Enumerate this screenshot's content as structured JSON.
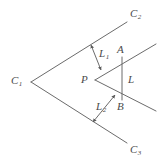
{
  "figure": {
    "kind": "line-diagram",
    "width": 163,
    "height": 163,
    "background_color": "#ffffff",
    "stroke_color": "#6b6b6b",
    "label_color": "#4a4a4a"
  },
  "labels": {
    "c1": "C",
    "c1_sub": "1",
    "c2": "C",
    "c2_sub": "2",
    "c3": "C",
    "c3_sub": "3",
    "p": "P",
    "a": "A",
    "b": "B",
    "l": "L",
    "l1": "L",
    "l1_sub": "1",
    "l2": "L",
    "l2_sub": "2"
  },
  "geometry": {
    "vertices": {
      "C1": [
        31,
        82
      ],
      "C2_end": [
        127,
        22
      ],
      "C3_end": [
        127,
        143
      ],
      "P": [
        95,
        80
      ],
      "A": [
        122,
        57
      ],
      "B": [
        122,
        100
      ],
      "A_ray_end": [
        156,
        44
      ],
      "B_ray_end": [
        156,
        111
      ]
    },
    "segments": [
      {
        "name": "cone1-upper-ray",
        "from": "C1",
        "to": "C2_end"
      },
      {
        "name": "cone1-lower-ray",
        "from": "C1",
        "to": "C3_end"
      },
      {
        "name": "cone2-upper-ray",
        "from": "P",
        "to": "A_ray_end"
      },
      {
        "name": "cone2-lower-ray",
        "from": "P",
        "to": "B_ray_end"
      },
      {
        "name": "segment-L-AB",
        "from": "A",
        "to": "B"
      }
    ],
    "measure_arrows": [
      {
        "name": "L1",
        "from": [
          91,
          45
        ],
        "to": [
          101,
          70
        ],
        "double_headed": true
      },
      {
        "name": "L2",
        "from": [
          115,
          95
        ],
        "to": [
          93,
          122
        ],
        "double_headed": true
      }
    ]
  }
}
